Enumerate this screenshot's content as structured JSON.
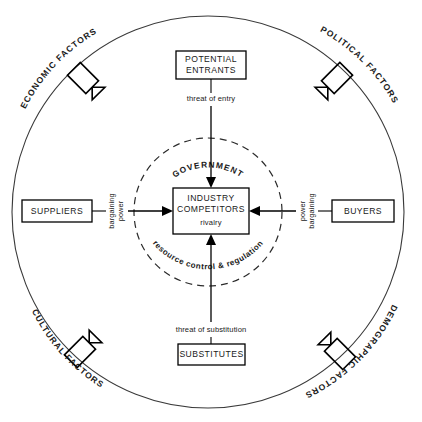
{
  "diagram": {
    "outer_circle_label_group": "macro environment ring",
    "center": {
      "box": {
        "line1": "INDUSTRY",
        "line2": "COMPETITORS",
        "sub": "rivalry"
      },
      "inner_ring_top_label": "GOVERNMENT",
      "inner_ring_bottom_label": "resource control & regulation"
    },
    "forces": {
      "top": {
        "box_line1": "POTENTIAL",
        "box_line2": "ENTRANTS",
        "flow_label": "threat of entry"
      },
      "bottom": {
        "box_line1": "SUBSTITUTES",
        "flow_label": "threat of substitution"
      },
      "left": {
        "box_line1": "SUPPLIERS",
        "flow_label_line1": "bargaining",
        "flow_label_line2": "power"
      },
      "right": {
        "box_line1": "BUYERS",
        "flow_label_line1": "bargaining",
        "flow_label_line2": "power"
      }
    },
    "environment_factors": [
      {
        "id": "economic",
        "label": "ECONOMIC FACTORS",
        "position": "top-left"
      },
      {
        "id": "political",
        "label": "POLITICAL FACTORS",
        "position": "top-right"
      },
      {
        "id": "cultural",
        "label": "CULTURAL FACTORS",
        "position": "bottom-left"
      },
      {
        "id": "demographic",
        "label": "DEMOGRAPHIC FACTORS",
        "position": "bottom-right"
      }
    ],
    "colors": {
      "stroke": "#000000",
      "circle_stroke": "#3a3a3a",
      "text": "#1a1a1a",
      "background": "#ffffff"
    }
  }
}
